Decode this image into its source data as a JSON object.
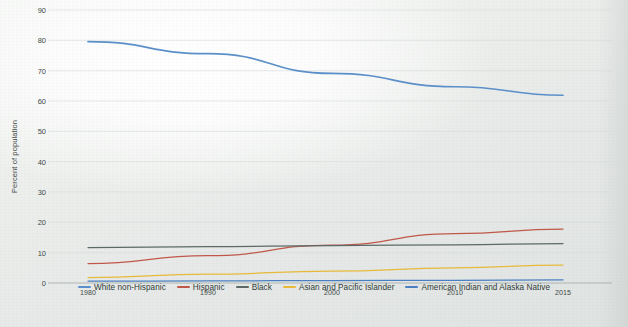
{
  "chart_data": {
    "type": "line",
    "title": "",
    "xlabel": "",
    "ylabel": "Percent of population",
    "x": [
      1980,
      1990,
      2000,
      2010,
      2015
    ],
    "xtick_labels": [
      "1980",
      "1990",
      "2000",
      "2010",
      "2015"
    ],
    "ytick_labels": [
      "0",
      "10",
      "20",
      "30",
      "40",
      "50",
      "60",
      "70",
      "80",
      "90"
    ],
    "ytick_values": [
      0,
      10,
      20,
      30,
      40,
      50,
      60,
      70,
      80,
      90
    ],
    "ylim": [
      0,
      90
    ],
    "xlim": [
      1980,
      2015
    ],
    "grid": true,
    "legend_position": "bottom",
    "series": [
      {
        "name": "White non-Hispanic",
        "color": "#5b8fc9",
        "values": [
          79.6,
          75.6,
          69.1,
          64.7,
          61.9
        ]
      },
      {
        "name": "Hispanic",
        "color": "#c0584a",
        "values": [
          6.4,
          9.0,
          12.5,
          16.3,
          17.8
        ]
      },
      {
        "name": "Black",
        "color": "#5c6a66",
        "values": [
          11.7,
          12.0,
          12.3,
          12.6,
          13.0
        ]
      },
      {
        "name": "Asian and Pacific Islander",
        "color": "#e8b93a",
        "values": [
          1.8,
          2.9,
          3.9,
          5.0,
          5.9
        ]
      },
      {
        "name": "American Indian and Alaska Native",
        "color": "#4a7fc1",
        "values": [
          0.6,
          0.7,
          0.8,
          0.9,
          1.0
        ]
      }
    ]
  },
  "axis": {
    "y_title": "Percent of population"
  },
  "legend": {
    "items": [
      {
        "label": "White non-Hispanic",
        "color": "#5b8fc9"
      },
      {
        "label": "Hispanic",
        "color": "#c0584a"
      },
      {
        "label": "Black",
        "color": "#5c6a66"
      },
      {
        "label": "Asian and Pacific Islander",
        "color": "#e8b93a"
      },
      {
        "label": "American Indian and Alaska Native",
        "color": "#4a7fc1"
      }
    ]
  }
}
